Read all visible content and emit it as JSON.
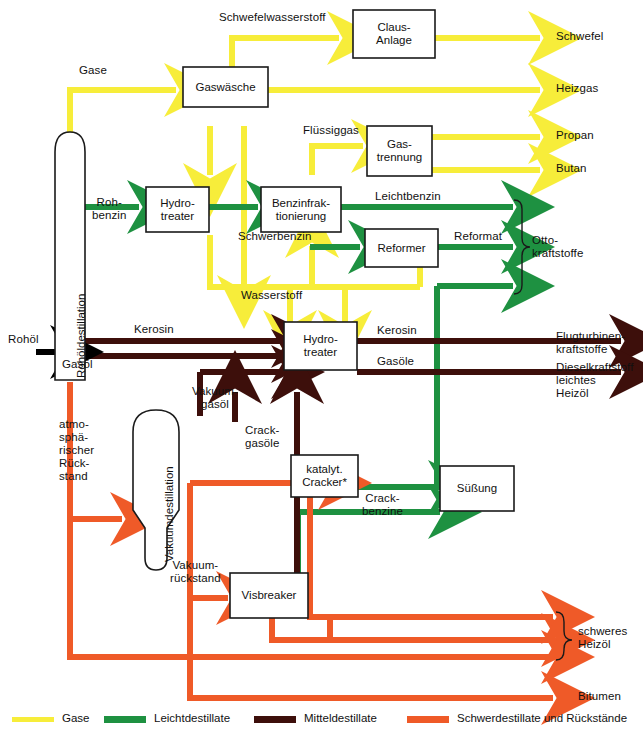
{
  "diagram": {
    "colors": {
      "gases": "#f7ed3a",
      "light_distillates": "#1e9141",
      "middle_distillates": "#3d0f0b",
      "heavy_distillates": "#ef5a28",
      "crude_feed": "#000000",
      "outline": "#1a1a1a",
      "background": "#ffffff"
    },
    "units": [
      {
        "id": "rohoeldestillation",
        "label": "Rohöldestillation",
        "shape": "column",
        "orientation": "vertical-text"
      },
      {
        "id": "vakuumdestillation",
        "label": "Vakuumdestillation",
        "shape": "column",
        "orientation": "vertical-text"
      },
      {
        "id": "gaswaesche",
        "label": "Gaswäsche",
        "shape": "box"
      },
      {
        "id": "claus",
        "label": "Claus-\nAnlage",
        "shape": "box"
      },
      {
        "id": "gastrennung",
        "label": "Gas-\ntrennung",
        "shape": "box"
      },
      {
        "id": "hydrotreater-1",
        "label": "Hydro-\ntreater",
        "shape": "box"
      },
      {
        "id": "benzinfraktionierung",
        "label": "Benzinfrak-\ntionierung",
        "shape": "box"
      },
      {
        "id": "reformer",
        "label": "Reformer",
        "shape": "box"
      },
      {
        "id": "hydrotreater-2",
        "label": "Hydro-\ntreater",
        "shape": "box"
      },
      {
        "id": "kat-cracker",
        "label": "katalyt.\nCracker*",
        "shape": "box"
      },
      {
        "id": "suessung",
        "label": "Süßung",
        "shape": "box"
      },
      {
        "id": "visbreaker",
        "label": "Visbreaker",
        "shape": "box"
      }
    ],
    "stream_labels": [
      {
        "id": "rohoel",
        "text": "Rohöl",
        "stream": "crude_feed"
      },
      {
        "id": "gase",
        "text": "Gase",
        "stream": "gases"
      },
      {
        "id": "schwefelwasserstoff",
        "text": "Schwefelwasserstoff",
        "stream": "gases"
      },
      {
        "id": "fluessiggas",
        "text": "Flüssiggas",
        "stream": "gases"
      },
      {
        "id": "wasserstoff",
        "text": "Wasserstoff",
        "stream": "gases"
      },
      {
        "id": "rohbenzin",
        "text": "Roh-\nbenzin",
        "stream": "light_distillates"
      },
      {
        "id": "leichtbenzin",
        "text": "Leichtbenzin",
        "stream": "light_distillates"
      },
      {
        "id": "schwerbenzin",
        "text": "Schwerbenzin",
        "stream": "light_distillates"
      },
      {
        "id": "reformat",
        "text": "Reformat",
        "stream": "light_distillates"
      },
      {
        "id": "crackbenzine",
        "text": "Crack-\nbenzine",
        "stream": "light_distillates"
      },
      {
        "id": "kerosin-in",
        "text": "Kerosin",
        "stream": "middle_distillates"
      },
      {
        "id": "gasoel",
        "text": "Gasöl",
        "stream": "middle_distillates"
      },
      {
        "id": "vakuumgasoel",
        "text": "Vakuum-\ngasöl",
        "stream": "middle_distillates"
      },
      {
        "id": "crackgasoele",
        "text": "Crack-\ngasöle",
        "stream": "middle_distillates"
      },
      {
        "id": "kerosin-out",
        "text": "Kerosin",
        "stream": "middle_distillates"
      },
      {
        "id": "gasoele-out",
        "text": "Gasöle",
        "stream": "middle_distillates"
      },
      {
        "id": "atm-rueckstand",
        "text": "atmo-\nsphä-\nrischer\nRück-\nstand",
        "stream": "heavy_distillates"
      },
      {
        "id": "vakuumrueckstand",
        "text": "Vakuum-\nrückstand",
        "stream": "heavy_distillates"
      }
    ],
    "products": [
      {
        "id": "schwefel",
        "text": "Schwefel",
        "stream": "gases"
      },
      {
        "id": "heizgas",
        "text": "Heizgas",
        "stream": "gases"
      },
      {
        "id": "propan",
        "text": "Propan",
        "stream": "gases"
      },
      {
        "id": "butan",
        "text": "Butan",
        "stream": "gases"
      },
      {
        "id": "ottokraftstoffe",
        "text": "Otto-\nkraftstoffe",
        "stream": "light_distillates",
        "brace": true
      },
      {
        "id": "flugturbinenkraftstoffe",
        "text": "Flugturbinen-\nkraftstoffe",
        "stream": "middle_distillates"
      },
      {
        "id": "dieselkraftstoff",
        "text": "Dieselkraftstoff\nleichtes\nHeizöl",
        "stream": "middle_distillates"
      },
      {
        "id": "schweres-heizoel",
        "text": "schweres\nHeizöl",
        "stream": "heavy_distillates",
        "brace": true
      },
      {
        "id": "bitumen",
        "text": "Bitumen",
        "stream": "heavy_distillates"
      }
    ],
    "legend": [
      {
        "id": "legend-gase",
        "label": "Gase",
        "color": "#f7ed3a"
      },
      {
        "id": "legend-leicht",
        "label": "Leichtdestillate",
        "color": "#1e9141"
      },
      {
        "id": "legend-mittel",
        "label": "Mitteldestillate",
        "color": "#3d0f0b"
      },
      {
        "id": "legend-schwer",
        "label": "Schwerdestillate und Rückstände",
        "color": "#ef5a28"
      }
    ]
  }
}
